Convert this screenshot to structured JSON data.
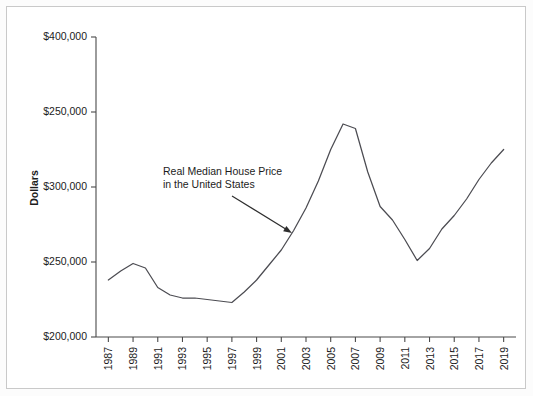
{
  "chart_data": {
    "type": "line",
    "title": "",
    "subtitle": "",
    "xlabel": "",
    "ylabel": "Dollars",
    "grid": false,
    "legend": false,
    "legend_position": "none",
    "line_color": "#4c4c52",
    "annotations": [
      {
        "name": "series-callout",
        "line1": "Real Median House Price",
        "line2": "in the United States",
        "arrow_from": [
          232,
          196
        ],
        "arrow_to": [
          292,
          233
        ]
      }
    ],
    "xlim": [
      1986,
      2020
    ],
    "ylim": [
      200000,
      400000
    ],
    "ytick_labels": [
      "$400,000",
      "$250,000",
      "$300,000",
      "$250,000",
      "$200,000"
    ],
    "ytick_positions": [
      400000,
      350000,
      300000,
      250000,
      200000
    ],
    "xtick_labels": [
      "1987",
      "1989",
      "1991",
      "1993",
      "1995",
      "1997",
      "1999",
      "2001",
      "2003",
      "2005",
      "2007",
      "2009",
      "2011",
      "2013",
      "2015",
      "2017",
      "2019"
    ],
    "x": [
      1987,
      1988,
      1989,
      1990,
      1991,
      1992,
      1993,
      1994,
      1995,
      1996,
      1997,
      1998,
      1999,
      2000,
      2001,
      2002,
      2003,
      2004,
      2005,
      2006,
      2007,
      2008,
      2009,
      2010,
      2011,
      2012,
      2013,
      2014,
      2015,
      2016,
      2017,
      2018,
      2019
    ],
    "values": [
      238000,
      244000,
      249000,
      246000,
      233000,
      228000,
      226000,
      226000,
      225000,
      224000,
      223000,
      230000,
      238000,
      248000,
      258000,
      271000,
      286000,
      304000,
      325000,
      342000,
      339000,
      310000,
      287000,
      278000,
      265000,
      251000,
      259000,
      272000,
      281000,
      292000,
      305000,
      316000,
      325000
    ],
    "series": [
      {
        "name": "Real Median House Price in the United States",
        "values": [
          238000,
          244000,
          249000,
          246000,
          233000,
          228000,
          226000,
          226000,
          225000,
          224000,
          223000,
          230000,
          238000,
          248000,
          258000,
          271000,
          286000,
          304000,
          325000,
          342000,
          339000,
          310000,
          287000,
          278000,
          265000,
          251000,
          259000,
          272000,
          281000,
          292000,
          305000,
          316000,
          325000
        ]
      }
    ]
  }
}
